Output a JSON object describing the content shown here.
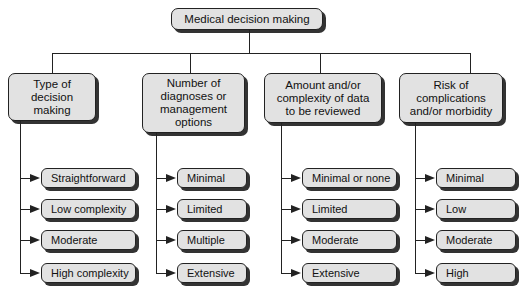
{
  "root": {
    "label": "Medical decision making"
  },
  "categories": [
    {
      "label": "Type of decision making",
      "lines": [
        "Type of",
        "decision",
        "making"
      ],
      "items": [
        "Straightforward",
        "Low complexity",
        "Moderate",
        "High complexity"
      ]
    },
    {
      "label": "Number of diagnoses or management options",
      "lines": [
        "Number of",
        "diagnoses or",
        "management",
        "options"
      ],
      "items": [
        "Minimal",
        "Limited",
        "Multiple",
        "Extensive"
      ]
    },
    {
      "label": "Amount and/or complexity of data to be reviewed",
      "lines": [
        "Amount and/or",
        "complexity of data",
        "to be reviewed"
      ],
      "items": [
        "Minimal or none",
        "Limited",
        "Moderate",
        "Extensive"
      ]
    },
    {
      "label": "Risk of complications and/or morbidity",
      "lines": [
        "Risk of",
        "complications",
        "and/or morbidity"
      ],
      "items": [
        "Minimal",
        "Low",
        "Moderate",
        "High"
      ]
    }
  ],
  "colors": {
    "box_fill": "#e2e2e2",
    "line": "#222222",
    "shadow": "#333333"
  }
}
